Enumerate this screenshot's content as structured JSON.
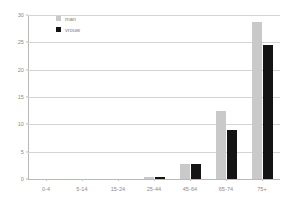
{
  "chart_data": {
    "type": "bar",
    "title": "",
    "subtitle": "",
    "xlabel": "",
    "ylabel": "",
    "categories": [
      "0-4",
      "5-14",
      "15-24",
      "25-44",
      "45-64",
      "65-74",
      "75+"
    ],
    "series": [
      {
        "name": "man",
        "color": "#c9c9c9",
        "values": [
          0,
          0,
          0,
          0.3,
          2.7,
          12.5,
          28.8
        ]
      },
      {
        "name": "vrouw",
        "color": "#141414",
        "values": [
          0,
          0,
          0,
          0.3,
          2.7,
          9.0,
          24.5
        ]
      }
    ],
    "ylim": [
      0,
      30
    ],
    "yticks": [
      0,
      5,
      10,
      15,
      20,
      25,
      30
    ],
    "ytick_labels": [
      "0",
      "5",
      "10",
      "15",
      "20",
      "25",
      "30"
    ],
    "grid": "horizontal",
    "legend_position": "top-left-inside",
    "axis_color": "#b9b9b9",
    "grid_color": "#d4d4d4",
    "label_color": "#8a8a8a",
    "background": "#ffffff"
  }
}
